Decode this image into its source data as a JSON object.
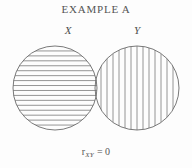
{
  "figure": {
    "title": "EXAMPLE A",
    "caption": {
      "symbol": "r",
      "subscript": "XY",
      "relation": "= 0"
    },
    "labels": {
      "left": "X",
      "right": "Y"
    },
    "colors": {
      "background": "#fdfdfd",
      "outline": "#6a6a6a",
      "hatch": "#7a7a7a",
      "text": "#4d4d4d"
    }
  },
  "chart_data": {
    "type": "diagram",
    "subtype": "venn-variance-circles",
    "title": "EXAMPLE A",
    "annotation": "r_XY = 0",
    "correlation": 0,
    "sets": [
      {
        "name": "X",
        "label": "X",
        "cx": 55,
        "cy": 88,
        "r": 42,
        "hatch": "horizontal",
        "hatch_count": 16
      },
      {
        "name": "Y",
        "label": "Y",
        "cx": 137,
        "cy": 88,
        "r": 42,
        "hatch": "vertical",
        "hatch_count": 13
      }
    ],
    "overlap": "tangent",
    "overlap_area": 0,
    "grid": false,
    "legend": false
  }
}
